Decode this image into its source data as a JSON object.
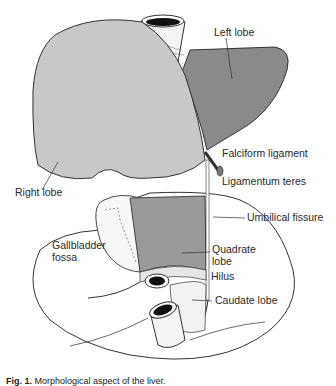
{
  "diagram": {
    "views": [
      {
        "name": "anterior view",
        "labels": [
          "Left lobe",
          "Right lobe",
          "Falciform ligament",
          "Ligamentum teres"
        ]
      },
      {
        "name": "inferior view",
        "labels": [
          "Umbilical fissure",
          "Gallbladder fossa",
          "Quadrate lobe",
          "Hilus",
          "Caudate lobe"
        ]
      }
    ],
    "labels": {
      "left_lobe": "Left lobe",
      "right_lobe": "Right lobe",
      "falciform_ligament": "Falciform ligament",
      "ligamentum_teres": "Ligamentum teres",
      "umbilical_fissure": "Umbilical fissure",
      "gallbladder_line1": "Gallbladder",
      "gallbladder_line2": "fossa",
      "quadrate_line1": "Quadrate",
      "quadrate_line2": "lobe",
      "hilus": "Hilus",
      "caudate_lobe": "Caudate lobe"
    },
    "caption": {
      "prefix": "Fig. 1.",
      "text": "Morphological aspect of the liver."
    },
    "colors": {
      "right_lobe": "#c8c8c8",
      "left_lobe": "#8a8a8a",
      "quadrate_lobe": "#9a9a9a",
      "outline": "#333333",
      "background": "#ffffff"
    }
  }
}
